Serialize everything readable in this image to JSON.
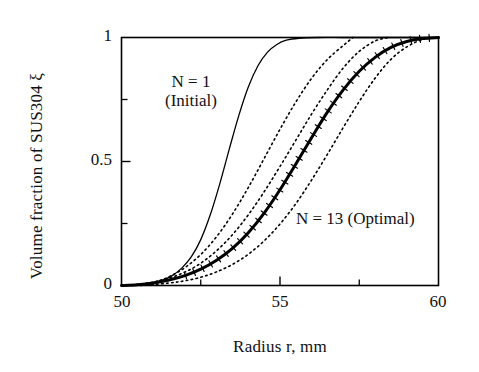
{
  "figure": {
    "background": "#ffffff",
    "ink": "#000000"
  },
  "axes": {
    "xlabel": "Radius r,  mm",
    "ylabel": "Volume fraction of SUS304 ξ",
    "x_ticklabels": [
      "50",
      "55",
      "60"
    ],
    "y_ticklabels": [
      "0",
      "0.5",
      "1"
    ]
  },
  "annotations": {
    "n1": {
      "line1": "N = 1",
      "line2": "(Initial)"
    },
    "n13": {
      "text": "N = 13 (Optimal)"
    }
  },
  "chart_data": {
    "type": "line",
    "title": "",
    "xlabel": "Radius r,  mm",
    "ylabel": "Volume fraction of SUS304 ξ",
    "xlim": [
      50,
      60
    ],
    "ylim": [
      0,
      1
    ],
    "xticks": [
      50,
      55,
      60
    ],
    "xticks_minor": [
      52.5,
      57.5
    ],
    "yticks": [
      0,
      0.5,
      1
    ],
    "yticks_minor": [
      0.25,
      0.75
    ],
    "grid": false,
    "legend": "inline-annotations",
    "series": [
      {
        "name": "N = 1 (Initial)",
        "style": "solid-thin",
        "linewidth": 1.3,
        "color": "#000000",
        "x": [
          50.0,
          50.5,
          51.0,
          51.3,
          51.6,
          51.9,
          52.2,
          52.5,
          52.8,
          53.1,
          53.4,
          53.7,
          54.0,
          54.3,
          54.6,
          54.9,
          55.2,
          55.6,
          56.2,
          57.0,
          58.0,
          59.0,
          60.0
        ],
        "y": [
          0.0,
          0.004,
          0.012,
          0.022,
          0.04,
          0.07,
          0.115,
          0.185,
          0.285,
          0.41,
          0.55,
          0.685,
          0.8,
          0.885,
          0.94,
          0.972,
          0.989,
          0.997,
          1.0,
          1.0,
          1.0,
          1.0,
          1.0
        ]
      },
      {
        "name": "N = 13 (Optimal)",
        "style": "solid-thick-with-tickmarks",
        "linewidth": 3.0,
        "color": "#000000",
        "x": [
          50.0,
          50.5,
          51.0,
          51.5,
          52.0,
          52.5,
          53.0,
          53.5,
          54.0,
          54.5,
          55.0,
          55.5,
          56.0,
          56.5,
          57.0,
          57.5,
          58.0,
          58.5,
          59.0,
          59.5,
          60.0
        ],
        "y": [
          0.0,
          0.003,
          0.01,
          0.022,
          0.04,
          0.066,
          0.102,
          0.15,
          0.213,
          0.292,
          0.386,
          0.49,
          0.597,
          0.7,
          0.79,
          0.864,
          0.92,
          0.96,
          0.984,
          0.996,
          1.0
        ]
      },
      {
        "name": "intermediate-upper",
        "style": "dotted",
        "linewidth": 1.6,
        "color": "#000000",
        "x": [
          50.6,
          51.0,
          51.5,
          52.0,
          52.5,
          53.0,
          53.5,
          54.0,
          54.5,
          55.0,
          55.5,
          56.0,
          56.5,
          57.0,
          57.3
        ],
        "y": [
          0.0,
          0.012,
          0.035,
          0.072,
          0.125,
          0.197,
          0.288,
          0.395,
          0.512,
          0.63,
          0.74,
          0.836,
          0.912,
          0.968,
          1.0
        ]
      },
      {
        "name": "intermediate-near-upper",
        "style": "dotted",
        "linewidth": 1.6,
        "color": "#000000",
        "x": [
          50.3,
          51.0,
          51.5,
          52.0,
          52.5,
          53.0,
          53.5,
          54.0,
          54.5,
          55.0,
          55.5,
          56.0,
          56.5,
          57.0,
          57.5,
          58.0,
          58.4
        ],
        "y": [
          0.0,
          0.014,
          0.03,
          0.054,
          0.09,
          0.14,
          0.205,
          0.285,
          0.378,
          0.48,
          0.586,
          0.692,
          0.79,
          0.878,
          0.944,
          0.986,
          1.0
        ]
      },
      {
        "name": "intermediate-lower",
        "style": "dotted",
        "linewidth": 1.6,
        "color": "#000000",
        "x": [
          50.0,
          50.8,
          51.5,
          52.0,
          52.5,
          53.0,
          53.5,
          54.0,
          54.5,
          55.0,
          55.5,
          56.0,
          56.5,
          57.0,
          57.5,
          58.0,
          58.5,
          59.0,
          59.5,
          60.0
        ],
        "y": [
          0.0,
          0.002,
          0.01,
          0.019,
          0.033,
          0.055,
          0.085,
          0.126,
          0.18,
          0.248,
          0.33,
          0.426,
          0.53,
          0.638,
          0.742,
          0.836,
          0.912,
          0.962,
          0.992,
          1.0
        ]
      }
    ]
  }
}
